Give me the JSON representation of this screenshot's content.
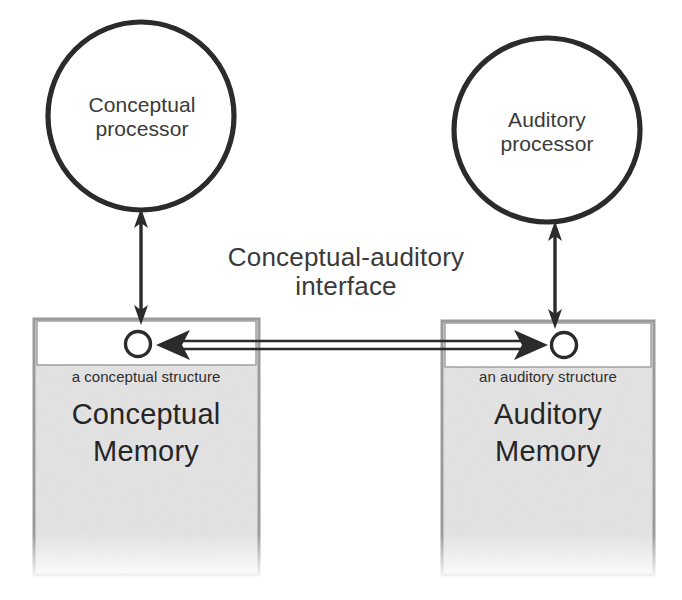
{
  "diagram": {
    "title": "Conceptual-auditory interface",
    "interface_label": "Conceptual-auditory\ninterface",
    "colors": {
      "stroke": "#2b2b2b",
      "memory_box_fill": "#e3e3e3",
      "memory_box_band_fill": "#ffffff",
      "memory_box_border": "#9a9a9a",
      "text": "#2b2b2b",
      "background": "#ffffff"
    },
    "processors": [
      {
        "id": "conceptual-processor",
        "label": "Conceptual\nprocessor",
        "shape": "circle"
      },
      {
        "id": "auditory-processor",
        "label": "Auditory\nprocessor",
        "shape": "circle"
      }
    ],
    "memories": [
      {
        "id": "conceptual-memory",
        "title": "Conceptual\nMemory",
        "structure_label": "a conceptual structure",
        "node": "structure-node"
      },
      {
        "id": "auditory-memory",
        "title": "Auditory\nMemory",
        "structure_label": "an auditory structure",
        "node": "structure-node"
      }
    ],
    "connections": [
      {
        "id": "conceptual-processor-to-memory",
        "from": "conceptual-processor",
        "to": "conceptual-memory",
        "style": "double-headed-arrow",
        "orientation": "vertical"
      },
      {
        "id": "auditory-processor-to-memory",
        "from": "auditory-processor",
        "to": "auditory-memory",
        "style": "double-headed-arrow",
        "orientation": "vertical"
      },
      {
        "id": "conceptual-auditory-link",
        "from": "conceptual-memory",
        "to": "auditory-memory",
        "style": "double-headed-open-shaft-arrow",
        "orientation": "horizontal"
      }
    ]
  }
}
